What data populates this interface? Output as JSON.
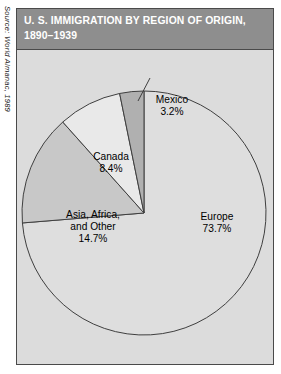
{
  "source_credit": {
    "text": "Source: World Almanac, 1989"
  },
  "header": {
    "title_line1": "U. S. IMMIGRATION BY REGION OF ORIGIN,",
    "title_line2": "1890–1939"
  },
  "colors": {
    "title_bar": "#8e8e8e",
    "title_text": "#ffffff",
    "plot_background": "#dcdcdc",
    "frame_border": "#4a4a4a",
    "slice_outline": "#3f3f3f",
    "europe": "#dedede",
    "asia_africa_other": "#c8c8c8",
    "canada": "#e9e9e9",
    "mexico": "#b0b0b0"
  },
  "chart_data": {
    "type": "pie",
    "title": "U. S. IMMIGRATION BY REGION OF ORIGIN, 1890–1939",
    "xlabel": "",
    "ylabel": "",
    "grid": false,
    "legend": "none",
    "value_unit": "percent",
    "total": 100.0,
    "start_angle_deg": 0,
    "direction": "clockwise",
    "center": {
      "x": 144,
      "y": 213
    },
    "radius": 122,
    "categories": [
      "Europe",
      "Asia, Africa, and Other",
      "Canada",
      "Mexico"
    ],
    "values": [
      73.7,
      14.7,
      8.4,
      3.2
    ],
    "slices": [
      {
        "label": "Europe",
        "label_line1": "Europe",
        "value": 73.7,
        "value_text": "73.7%",
        "color": "#dedede",
        "start_deg": 0.0,
        "end_deg": 265.32,
        "leader_line": false
      },
      {
        "label": "Asia, Africa, and Other",
        "label_line1": "Asia, Africa,",
        "label_line2": "and Other",
        "value": 14.7,
        "value_text": "14.7%",
        "color": "#c8c8c8",
        "start_deg": 265.32,
        "end_deg": 318.24,
        "leader_line": false
      },
      {
        "label": "Canada",
        "label_line1": "Canada",
        "value": 8.4,
        "value_text": "8.4%",
        "color": "#e9e9e9",
        "start_deg": 318.24,
        "end_deg": 348.48,
        "leader_line": false
      },
      {
        "label": "Mexico",
        "label_line1": "Mexico",
        "value": 3.2,
        "value_text": "3.2%",
        "color": "#b0b0b0",
        "start_deg": 348.48,
        "end_deg": 360.0,
        "leader_line": true
      }
    ],
    "annotations": [
      {
        "name": "mexico-leader-line",
        "from": [
          150,
          78
        ],
        "to": [
          138,
          101
        ]
      }
    ]
  }
}
